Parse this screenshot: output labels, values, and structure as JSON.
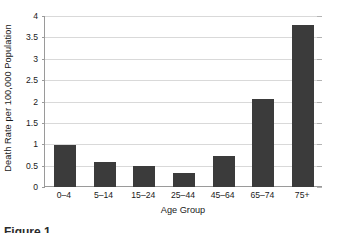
{
  "chart_data": {
    "type": "bar",
    "title": "",
    "xlabel": "Age Group",
    "ylabel": "Death Rate per 100,000 Population",
    "categories": [
      "0–4",
      "5–14",
      "15–24",
      "25–44",
      "45–64",
      "65–74",
      "75+"
    ],
    "values": [
      0.99,
      0.59,
      0.5,
      0.33,
      0.73,
      2.07,
      3.78
    ],
    "ylim": [
      0,
      4
    ],
    "ytick_labels": [
      "0",
      "0.5",
      "1",
      "1.5",
      "2",
      "2.5",
      "3",
      "3.5",
      "4"
    ],
    "ytick_values": [
      0,
      0.5,
      1,
      1.5,
      2,
      2.5,
      3,
      3.5,
      4
    ],
    "grid": true,
    "legend": "none",
    "bar_color": "#3b3b3b",
    "gridline_color": "#d9d9d9",
    "axis_color": "#9a9a9a",
    "background": "#ffffff"
  },
  "caption": {
    "text": "Figure 1."
  }
}
